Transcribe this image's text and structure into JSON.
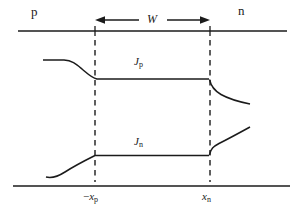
{
  "diagram": {
    "regions": {
      "p_label": "p",
      "n_label": "n"
    },
    "depletion_width": {
      "label": "W"
    },
    "curves": {
      "jp": {
        "symbol": "J",
        "subscript": "p"
      },
      "jn": {
        "symbol": "J",
        "subscript": "n"
      }
    },
    "boundaries": {
      "left": {
        "sign": "−",
        "symbol": "x",
        "subscript": "p"
      },
      "right": {
        "symbol": "x",
        "subscript": "n"
      }
    },
    "colors": {
      "stroke": "#1b1b1b",
      "background": "#ffffff"
    }
  }
}
